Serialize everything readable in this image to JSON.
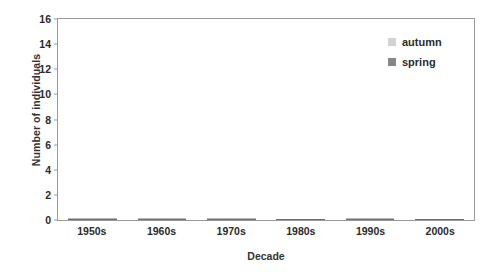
{
  "chart_data": {
    "type": "bar",
    "subtype": "stacked-vertical",
    "title": "",
    "xlabel": "Decade",
    "ylabel": "Number of individuals",
    "categories": [
      "1950s",
      "1960s",
      "1970s",
      "1980s",
      "1990s",
      "2000s"
    ],
    "series": [
      {
        "name": "spring",
        "color": "#878787",
        "values": [
          2,
          5,
          4,
          4,
          4,
          1
        ]
      },
      {
        "name": "autumn",
        "color": "#d2d2d2",
        "values": [
          2,
          10,
          6,
          0,
          2,
          0
        ]
      }
    ],
    "stack_order": [
      "spring",
      "autumn"
    ],
    "totals": [
      4,
      15,
      10,
      4,
      6,
      1
    ],
    "ylim": [
      0,
      16
    ],
    "ytick_values": [
      0,
      2,
      4,
      6,
      8,
      10,
      12,
      14,
      16
    ],
    "ytick_labels": [
      "0",
      "2",
      "4",
      "6",
      "8",
      "10",
      "12",
      "14",
      "16"
    ],
    "ytick_step": 2,
    "grid": false,
    "legend_position": "top-right",
    "legend_entries": [
      {
        "label": "autumn",
        "color": "#d2d2d2"
      },
      {
        "label": "spring",
        "color": "#878787"
      }
    ],
    "frame_color": "#9a9a9a",
    "background": "#ffffff"
  }
}
